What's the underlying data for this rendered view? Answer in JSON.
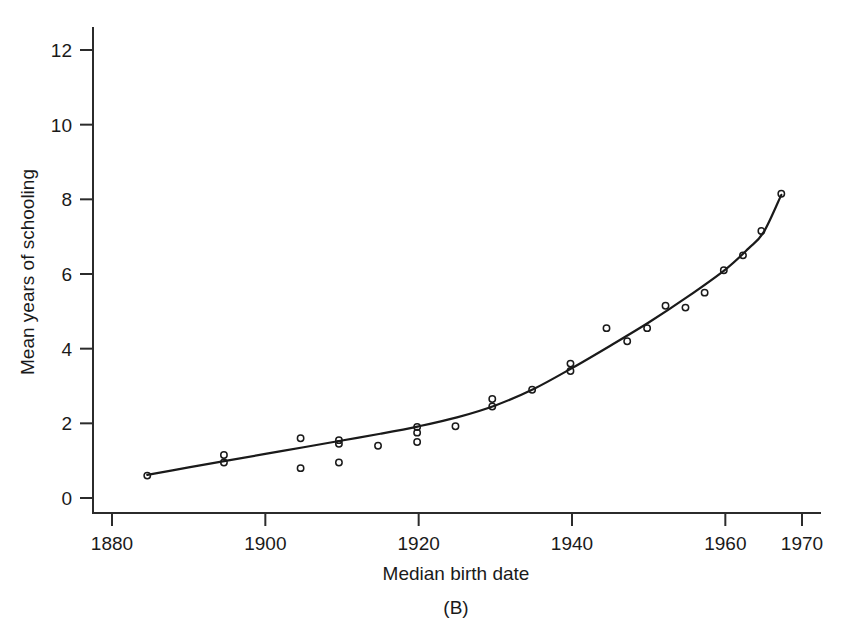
{
  "chart_data": {
    "type": "scatter",
    "title": "",
    "panel_label": "(B)",
    "xlabel": "Median birth date",
    "ylabel": "Mean years of schooling",
    "xlim": [
      1876,
      1972
    ],
    "ylim": [
      0,
      12.6
    ],
    "xticks": [
      1880,
      1900,
      1920,
      1940,
      1960,
      1970
    ],
    "xtick_labels": [
      "1880",
      "1900",
      "1920",
      "1940",
      "1960",
      "1970"
    ],
    "yticks": [
      0,
      2,
      4,
      6,
      8,
      10,
      12
    ],
    "ytick_labels": [
      "0",
      "2",
      "4",
      "6",
      "8",
      "10",
      "12"
    ],
    "grid": false,
    "legend": "none",
    "marker": "open-circle",
    "points": [
      {
        "x": 1884.6,
        "y": 0.6
      },
      {
        "x": 1894.6,
        "y": 1.15
      },
      {
        "x": 1894.6,
        "y": 0.95
      },
      {
        "x": 1904.6,
        "y": 1.6
      },
      {
        "x": 1904.6,
        "y": 0.8
      },
      {
        "x": 1909.6,
        "y": 1.55
      },
      {
        "x": 1909.6,
        "y": 1.45
      },
      {
        "x": 1909.6,
        "y": 0.95
      },
      {
        "x": 1914.7,
        "y": 1.4
      },
      {
        "x": 1919.8,
        "y": 1.9
      },
      {
        "x": 1919.8,
        "y": 1.75
      },
      {
        "x": 1919.8,
        "y": 1.5
      },
      {
        "x": 1924.8,
        "y": 1.92
      },
      {
        "x": 1929.6,
        "y": 2.65
      },
      {
        "x": 1929.6,
        "y": 2.45
      },
      {
        "x": 1934.8,
        "y": 2.9
      },
      {
        "x": 1939.8,
        "y": 3.6
      },
      {
        "x": 1939.8,
        "y": 3.4
      },
      {
        "x": 1944.5,
        "y": 4.55
      },
      {
        "x": 1947.2,
        "y": 4.2
      },
      {
        "x": 1949.8,
        "y": 4.55
      },
      {
        "x": 1952.2,
        "y": 5.15
      },
      {
        "x": 1954.8,
        "y": 5.1
      },
      {
        "x": 1957.3,
        "y": 5.5
      },
      {
        "x": 1959.8,
        "y": 6.1
      },
      {
        "x": 1962.3,
        "y": 6.5
      },
      {
        "x": 1964.7,
        "y": 7.15
      },
      {
        "x": 1967.3,
        "y": 8.15
      }
    ],
    "fit_curve": [
      {
        "x": 1884.6,
        "y": 0.62
      },
      {
        "x": 1890.0,
        "y": 0.82
      },
      {
        "x": 1895.0,
        "y": 1.0
      },
      {
        "x": 1900.0,
        "y": 1.18
      },
      {
        "x": 1905.0,
        "y": 1.36
      },
      {
        "x": 1910.0,
        "y": 1.54
      },
      {
        "x": 1915.0,
        "y": 1.72
      },
      {
        "x": 1920.0,
        "y": 1.92
      },
      {
        "x": 1925.0,
        "y": 2.16
      },
      {
        "x": 1930.0,
        "y": 2.48
      },
      {
        "x": 1935.0,
        "y": 2.92
      },
      {
        "x": 1940.0,
        "y": 3.48
      },
      {
        "x": 1945.0,
        "y": 4.08
      },
      {
        "x": 1950.0,
        "y": 4.7
      },
      {
        "x": 1955.0,
        "y": 5.38
      },
      {
        "x": 1960.0,
        "y": 6.12
      },
      {
        "x": 1963.0,
        "y": 6.68
      },
      {
        "x": 1965.0,
        "y": 7.12
      },
      {
        "x": 1967.3,
        "y": 8.12
      }
    ]
  }
}
